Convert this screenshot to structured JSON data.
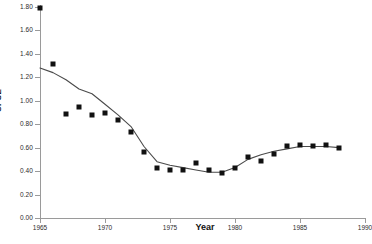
{
  "chart_data": {
    "type": "scatter",
    "title": "",
    "xlabel": "Year",
    "ylabel": "CPUE",
    "xlim": [
      1965,
      1990
    ],
    "ylim": [
      0.0,
      1.8
    ],
    "grid": false,
    "legend": "none",
    "x_ticks": [
      "1965",
      "1970",
      "1975",
      "1980",
      "1985",
      "1990"
    ],
    "x_tick_values": [
      1965,
      1970,
      1975,
      1980,
      1985,
      1990
    ],
    "y_ticks": [
      "0.00",
      "0.20",
      "0.40",
      "0.60",
      "0.80",
      "1.00",
      "1.20",
      "1.40",
      "1.60",
      "1.80"
    ],
    "y_tick_values": [
      0.0,
      0.2,
      0.4,
      0.6,
      0.8,
      1.0,
      1.2,
      1.4,
      1.6,
      1.8
    ],
    "marker_color": "#111111",
    "line_color": "#4a4a4a",
    "axis_color": "#9a9a9a",
    "series": [
      {
        "name": "CPUE observations",
        "style": "markers",
        "x": [
          1965,
          1966,
          1967,
          1968,
          1969,
          1970,
          1971,
          1972,
          1973,
          1974,
          1975,
          1976,
          1977,
          1978,
          1979,
          1980,
          1981,
          1982,
          1983,
          1984,
          1985,
          1986,
          1987,
          1988
        ],
        "y": [
          1.79,
          1.31,
          0.89,
          0.95,
          0.88,
          0.9,
          0.84,
          0.73,
          0.56,
          0.43,
          0.41,
          0.41,
          0.47,
          0.41,
          0.38,
          0.43,
          0.52,
          0.49,
          0.55,
          0.61,
          0.62,
          0.61,
          0.62,
          0.6
        ]
      },
      {
        "name": "Fitted trend",
        "style": "line",
        "x": [
          1965,
          1966,
          1967,
          1968,
          1969,
          1970,
          1971,
          1972,
          1973,
          1974,
          1975,
          1976,
          1977,
          1978,
          1979,
          1980,
          1981,
          1982,
          1983,
          1984,
          1985,
          1986,
          1987,
          1988
        ],
        "y": [
          1.28,
          1.24,
          1.18,
          1.1,
          1.06,
          0.97,
          0.88,
          0.78,
          0.61,
          0.48,
          0.45,
          0.43,
          0.41,
          0.39,
          0.39,
          0.43,
          0.5,
          0.54,
          0.57,
          0.59,
          0.61,
          0.61,
          0.61,
          0.6
        ]
      }
    ]
  },
  "axes": {
    "x_title": "Year",
    "y_title": "CPUE"
  }
}
